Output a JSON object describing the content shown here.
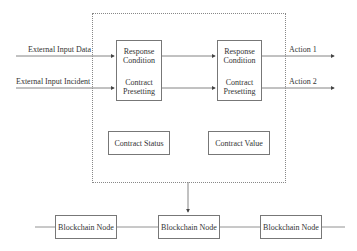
{
  "inputs": {
    "data": "External Input Data",
    "incident": "External Input Incident"
  },
  "left_box": {
    "line1": "Response",
    "line2": "Condition",
    "line3": "Contract",
    "line4": "Presetting"
  },
  "right_box": {
    "line1": "Response",
    "line2": "Condition",
    "line3": "Contract",
    "line4": "Presetting"
  },
  "outputs": {
    "action1": "Action 1",
    "action2": "Action 2"
  },
  "state": {
    "status": "Contract Status",
    "value": "Contract Value"
  },
  "nodes": [
    {
      "label": "Blockchain Node"
    },
    {
      "label": "Blockchain Node"
    },
    {
      "label": "Blockchain Node"
    }
  ]
}
